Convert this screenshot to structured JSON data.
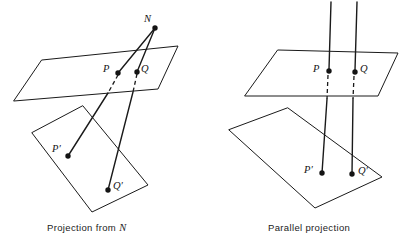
{
  "figure": {
    "background_color": "#ffffff",
    "ink_color": "#141414",
    "width": 403,
    "height": 247
  },
  "panels": [
    {
      "id": "projection-from-n",
      "caption_prefix": "Projection from",
      "caption_symbol": "N",
      "caption_full": "Projection from N",
      "caption_x": 47,
      "caption_y": 222,
      "labels": [
        {
          "name": "point-n",
          "text": "N",
          "x": 144,
          "y": 14
        },
        {
          "name": "point-p",
          "text": "P",
          "x": 103,
          "y": 64
        },
        {
          "name": "point-q",
          "text": "Q",
          "x": 141,
          "y": 64
        },
        {
          "name": "point-p-prime",
          "text": "P′",
          "x": 52,
          "y": 144
        },
        {
          "name": "point-q-prime",
          "text": "Q′",
          "x": 113,
          "y": 181
        }
      ],
      "points": [
        {
          "name": "n",
          "cx": 155,
          "cy": 28,
          "r": 2.6
        },
        {
          "name": "p",
          "cx": 118,
          "cy": 73,
          "r": 2.6
        },
        {
          "name": "q",
          "cx": 137,
          "cy": 72,
          "r": 2.6
        },
        {
          "name": "p-prime",
          "cx": 68,
          "cy": 156,
          "r": 2.6
        },
        {
          "name": "q-prime",
          "cx": 108,
          "cy": 190,
          "r": 2.6
        }
      ],
      "upper_plane_points": "42,60 178,46 158,89 14,101",
      "lower_plane_points": "83,106 148,185 92,212 32,133",
      "rays": [
        {
          "name": "ray-n-to-p",
          "x1": 155,
          "y1": 28,
          "x2": 118,
          "y2": 73
        },
        {
          "name": "ray-p-to-p-prime",
          "x1": 118,
          "y1": 73,
          "x2": 68,
          "y2": 156,
          "dash_to": {
            "x": 109,
            "y": 92
          }
        },
        {
          "name": "ray-n-to-q",
          "x1": 155,
          "y1": 28,
          "x2": 137,
          "y2": 72
        },
        {
          "name": "ray-q-to-q-prime",
          "x1": 137,
          "y1": 72,
          "x2": 108,
          "y2": 190,
          "dash_to": {
            "x": 132,
            "y": 91
          }
        }
      ]
    },
    {
      "id": "parallel-projection",
      "caption_prefix": "Parallel projection",
      "caption_symbol": "",
      "caption_full": "Parallel projection",
      "caption_x": 268,
      "caption_y": 222,
      "labels": [
        {
          "name": "point-p",
          "text": "P",
          "x": 313,
          "y": 64
        },
        {
          "name": "point-q",
          "text": "Q",
          "x": 360,
          "y": 64
        },
        {
          "name": "point-p-prime",
          "text": "P′",
          "x": 304,
          "y": 165
        },
        {
          "name": "point-q-prime",
          "text": "Q′",
          "x": 358,
          "y": 166
        }
      ],
      "points": [
        {
          "name": "p",
          "cx": 329,
          "cy": 71,
          "r": 2.6
        },
        {
          "name": "q",
          "cx": 355,
          "cy": 72,
          "r": 2.6
        },
        {
          "name": "p-prime",
          "cx": 322,
          "cy": 173,
          "r": 2.6
        },
        {
          "name": "q-prime",
          "cx": 352,
          "cy": 174,
          "r": 2.6
        }
      ],
      "upper_plane_points": "278,50 398,53 378,96 245,96",
      "lower_plane_points": "288,108 382,177 315,208 229,130",
      "rays": [
        {
          "name": "ray-upper-left",
          "x1": 331,
          "y1": 2,
          "x2": 329,
          "y2": 71
        },
        {
          "name": "ray-upper-right",
          "x1": 357,
          "y1": 2,
          "x2": 355,
          "y2": 72
        },
        {
          "name": "ray-hidden-left",
          "x1": 329,
          "y1": 73,
          "x2": 326,
          "y2": 100,
          "dashed": true
        },
        {
          "name": "ray-hidden-right",
          "x1": 355,
          "y1": 74,
          "x2": 352,
          "y2": 100,
          "dashed": true
        },
        {
          "name": "ray-lower-left",
          "x1": 326,
          "y1": 100,
          "x2": 322,
          "y2": 173
        },
        {
          "name": "ray-lower-right",
          "x1": 352,
          "y1": 100,
          "x2": 352,
          "y2": 174
        }
      ]
    }
  ]
}
